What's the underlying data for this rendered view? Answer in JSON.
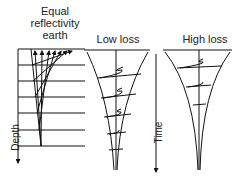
{
  "panels": [
    {
      "title_lines": [
        "Equal",
        "reflectivity",
        "earth"
      ],
      "axis_label": "Depth"
    },
    {
      "title": "Low loss",
      "axis_label": "Time"
    },
    {
      "title": "High loss"
    }
  ],
  "colors": {
    "line": "#111111",
    "background": "#ffffff"
  }
}
